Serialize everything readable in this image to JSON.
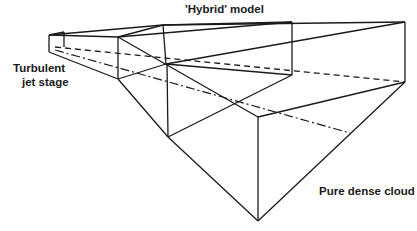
{
  "diagram": {
    "labels": {
      "hybrid": "'Hybrid' model",
      "turbulent_line1": "Turbulent",
      "turbulent_line2": "jet stage",
      "pure": "Pure dense cloud"
    },
    "line_color": "#1a1a1a",
    "background": "#ffffff"
  }
}
